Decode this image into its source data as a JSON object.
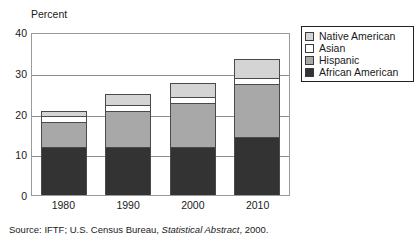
{
  "chart_data": {
    "type": "bar",
    "subtype": "stacked-bar",
    "title": "",
    "xlabel": "",
    "ylabel": "Percent",
    "ylim": [
      0,
      40
    ],
    "yticks": [
      0,
      10,
      20,
      30,
      40
    ],
    "grid": true,
    "legend_position": "right",
    "categories": [
      "1980",
      "1990",
      "2000",
      "2010"
    ],
    "series": [
      {
        "name": "African American",
        "color": "#333333",
        "values": [
          12.0,
          12.0,
          12.0,
          14.3
        ]
      },
      {
        "name": "Hispanic",
        "color": "#a8a8a8",
        "values": [
          6.1,
          8.9,
          10.9,
          13.4
        ]
      },
      {
        "name": "Asian",
        "color": "#ffffff",
        "values": [
          1.5,
          1.5,
          1.5,
          1.4
        ]
      },
      {
        "name": "Native American",
        "color": "#d4d4d4",
        "values": [
          1.4,
          2.6,
          3.4,
          4.7
        ]
      }
    ],
    "totals": [
      21.0,
      25.0,
      27.8,
      33.8
    ],
    "stack_order_bottom_to_top": [
      "African American",
      "Hispanic",
      "Asian",
      "Native American"
    ]
  },
  "axis": {
    "y_title": "Percent",
    "y_tick_labels": [
      "40",
      "30",
      "20",
      "10",
      "0"
    ],
    "x_tick_labels": [
      "1980",
      "1990",
      "2000",
      "2010"
    ]
  },
  "legend": {
    "items": [
      {
        "label": "Native American",
        "color": "#d4d4d4"
      },
      {
        "label": "Asian",
        "color": "#ffffff"
      },
      {
        "label": "Hispanic",
        "color": "#a8a8a8"
      },
      {
        "label": "African American",
        "color": "#333333"
      }
    ]
  },
  "source": {
    "prefix": "Source: IFTF; U.S. Census Bureau, ",
    "italic": "Statistical Abstract",
    "suffix": ", 2000."
  },
  "colors": {
    "african_american": "#333333",
    "hispanic": "#a8a8a8",
    "asian": "#ffffff",
    "native_american": "#d4d4d4",
    "grid": "#8d8d8d",
    "frame": "#9a9a9a",
    "text": "#1a1a1a"
  }
}
